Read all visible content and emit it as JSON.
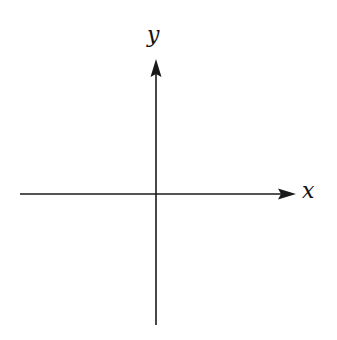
{
  "diagram": {
    "type": "cartesian-axes",
    "axes": {
      "x": {
        "label": "x",
        "direction": "right",
        "start": [
          20,
          194
        ],
        "end": [
          296,
          194
        ]
      },
      "y": {
        "label": "y",
        "direction": "up",
        "start": [
          156,
          325
        ],
        "end": [
          156,
          59
        ]
      }
    },
    "origin": [
      156,
      194
    ],
    "colors": {
      "line": "#1a1a1a",
      "background": "#ffffff"
    }
  }
}
